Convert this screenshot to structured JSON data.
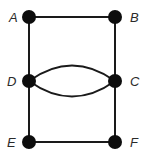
{
  "diagram": {
    "type": "multigraph",
    "nodes": [
      {
        "id": "A",
        "label": "A",
        "x": 29,
        "y": 17,
        "label_x": 9,
        "label_y": 22
      },
      {
        "id": "B",
        "label": "B",
        "x": 115,
        "y": 17,
        "label_x": 130,
        "label_y": 22
      },
      {
        "id": "D",
        "label": "D",
        "x": 29,
        "y": 81,
        "label_x": 8,
        "label_y": 86
      },
      {
        "id": "C",
        "label": "C",
        "x": 115,
        "y": 81,
        "label_x": 131,
        "label_y": 86
      },
      {
        "id": "E",
        "label": "E",
        "x": 29,
        "y": 142,
        "label_x": 8,
        "label_y": 147
      },
      {
        "id": "F",
        "label": "F",
        "x": 115,
        "y": 142,
        "label_x": 131,
        "label_y": 147
      }
    ],
    "edges": [
      {
        "from": "A",
        "to": "B",
        "shape": "straight"
      },
      {
        "from": "A",
        "to": "D",
        "shape": "straight"
      },
      {
        "from": "B",
        "to": "C",
        "shape": "straight"
      },
      {
        "from": "D",
        "to": "C",
        "shape": "curve-up"
      },
      {
        "from": "D",
        "to": "C",
        "shape": "curve-down"
      },
      {
        "from": "D",
        "to": "E",
        "shape": "straight"
      },
      {
        "from": "C",
        "to": "F",
        "shape": "straight"
      },
      {
        "from": "E",
        "to": "F",
        "shape": "straight"
      }
    ],
    "colors": {
      "node": "#0d0d0d",
      "edge": "#1a1a1a",
      "label": "#2a2a2a",
      "background": "#ffffff"
    }
  }
}
